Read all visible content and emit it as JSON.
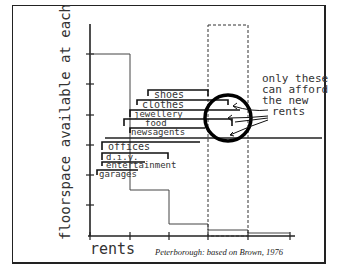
{
  "diagram": {
    "title": "",
    "y_axis_label": "floorspace available at each rent",
    "x_axis_label": "rents",
    "caption": "Peterborough: based on Brown, 1976",
    "annotation": "only these can afford the new rents",
    "annotation_lines": [
      "only these",
      "can afford",
      "the new",
      "rents"
    ],
    "categories": [
      {
        "label": "shoes"
      },
      {
        "label": "clothes"
      },
      {
        "label": "jewellery"
      },
      {
        "label": "food"
      },
      {
        "label": "newsagents"
      },
      {
        "label": "offices"
      },
      {
        "label": "d.i.y."
      },
      {
        "label": "entertainment"
      },
      {
        "label": "garages"
      }
    ],
    "step_profile": "floorspace decreases stepwise as rent increases",
    "highlight": "dashed box marks new rent band; circle marks uses that can afford it"
  }
}
